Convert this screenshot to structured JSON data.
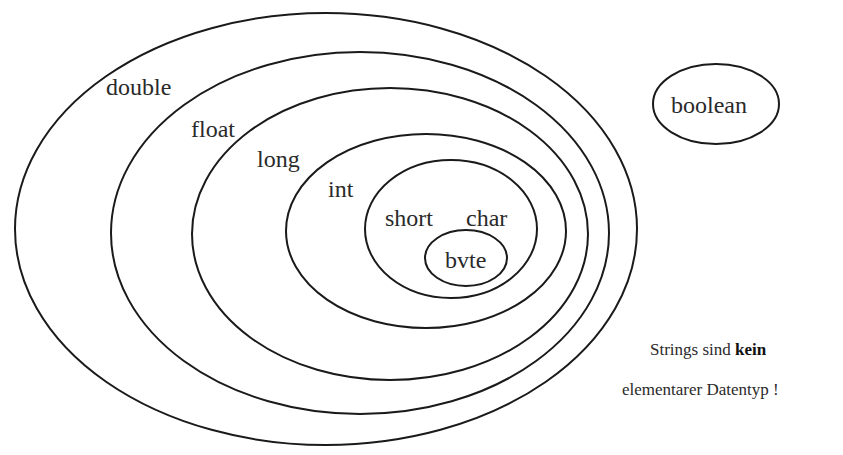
{
  "diagram": {
    "title": "",
    "stroke_color": "#1a1a1a",
    "background": "#ffffff",
    "sets": [
      {
        "id": "double",
        "label": "double",
        "cx": 326,
        "cy": 229,
        "rx": 311,
        "ry": 216
      },
      {
        "id": "float",
        "label": "float",
        "cx": 360,
        "cy": 233,
        "rx": 249,
        "ry": 181
      },
      {
        "id": "long",
        "label": "long",
        "cx": 390,
        "cy": 234,
        "rx": 198,
        "ry": 146
      },
      {
        "id": "int",
        "label": "int",
        "cx": 426,
        "cy": 231,
        "rx": 140,
        "ry": 97
      },
      {
        "id": "short_char",
        "label_left": "short",
        "label_right": "char",
        "cx": 451,
        "cy": 229,
        "rx": 86,
        "ry": 69
      },
      {
        "id": "byte",
        "label": "bvte",
        "cx": 466,
        "cy": 258,
        "rx": 41,
        "ry": 28
      },
      {
        "id": "boolean",
        "label": "boolean",
        "cx": 716,
        "cy": 104,
        "rx": 63,
        "ry": 40
      }
    ],
    "note": {
      "line1_prefix": "Strings sind ",
      "line1_bold": "kein",
      "line2": "elementarer Datentyp !"
    }
  }
}
